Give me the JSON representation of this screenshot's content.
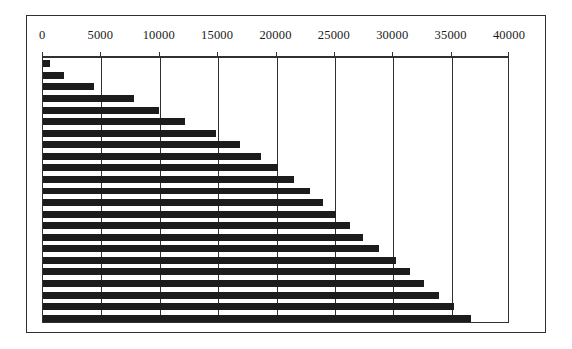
{
  "chart": {
    "type": "bar",
    "orientation": "horizontal",
    "title": "",
    "subtitle": "",
    "xlabel": "",
    "ylabel": ""
  },
  "axis": {
    "tick_labels": [
      "0",
      "5000",
      "10000",
      "15000",
      "20000",
      "25000",
      "30000",
      "35000",
      "40000"
    ],
    "min": 0,
    "max": 40000,
    "step": 5000
  },
  "style": {
    "bar_color": "#1c1c1c",
    "grid_color": "#303030",
    "frame_color": "#303030",
    "background": "#ffffff"
  },
  "chart_data": {
    "type": "bar",
    "orientation": "horizontal",
    "title": "",
    "subtitle": "",
    "xlabel": "",
    "ylabel": "",
    "xlim": [
      0,
      40000
    ],
    "ylim": [
      0,
      23
    ],
    "xticks": [
      0,
      5000,
      10000,
      15000,
      20000,
      25000,
      30000,
      35000,
      40000
    ],
    "tick_labels": [
      "0",
      "5000",
      "10000",
      "15000",
      "20000",
      "25000",
      "30000",
      "35000",
      "40000"
    ],
    "grid": "vertical",
    "grid_on": true,
    "legend": "none",
    "legend_position": "none",
    "categories": [
      "1",
      "2",
      "3",
      "4",
      "5",
      "6",
      "7",
      "8",
      "9",
      "10",
      "11",
      "12",
      "13",
      "14",
      "15",
      "16",
      "17",
      "18",
      "19",
      "20",
      "21",
      "22",
      "23"
    ],
    "values": [
      600,
      1800,
      4400,
      7800,
      9900,
      12200,
      14800,
      16900,
      18700,
      20100,
      21500,
      22900,
      24000,
      25100,
      26300,
      27400,
      28800,
      30200,
      31400,
      32600,
      33900,
      35200,
      36700
    ],
    "series": [
      {
        "name": "values",
        "values": [
          600,
          1800,
          4400,
          7800,
          9900,
          12200,
          14800,
          16900,
          18700,
          20100,
          21500,
          22900,
          24000,
          25100,
          26300,
          27400,
          28800,
          30200,
          31400,
          32600,
          33900,
          35200,
          36700
        ]
      }
    ],
    "sorted": "ascending",
    "n_bars": 23,
    "annotations": []
  }
}
